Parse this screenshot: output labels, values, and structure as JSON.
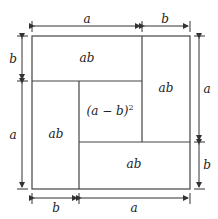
{
  "diagram": {
    "regions": {
      "top_left": "ab",
      "right": "ab",
      "left": "ab",
      "bottom": "ab",
      "center": "(a − b)",
      "center_exp": "2"
    },
    "dimensions": {
      "top_a": "a",
      "top_b": "b",
      "left_b": "b",
      "left_a": "a",
      "right_a": "a",
      "right_b": "b",
      "bottom_b": "b",
      "bottom_a": "a"
    },
    "colors": {
      "line": "#333333",
      "background": "#ffffff"
    }
  }
}
